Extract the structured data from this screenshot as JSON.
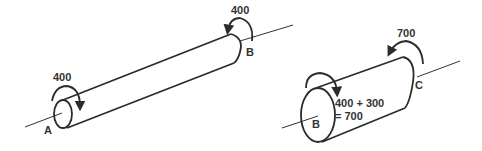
{
  "diagram": {
    "colors": {
      "stroke": "#2b2b2b",
      "text": "#333333",
      "background": "#ffffff"
    },
    "left_shaft": {
      "end_a": {
        "label": "A",
        "torque": "400"
      },
      "end_b": {
        "label": "B",
        "torque": "400"
      }
    },
    "right_shaft": {
      "end_b": {
        "label": "B",
        "torque_line1": "400 + 300",
        "torque_line2": "= 700"
      },
      "end_c": {
        "label": "C",
        "torque": "700"
      }
    }
  }
}
